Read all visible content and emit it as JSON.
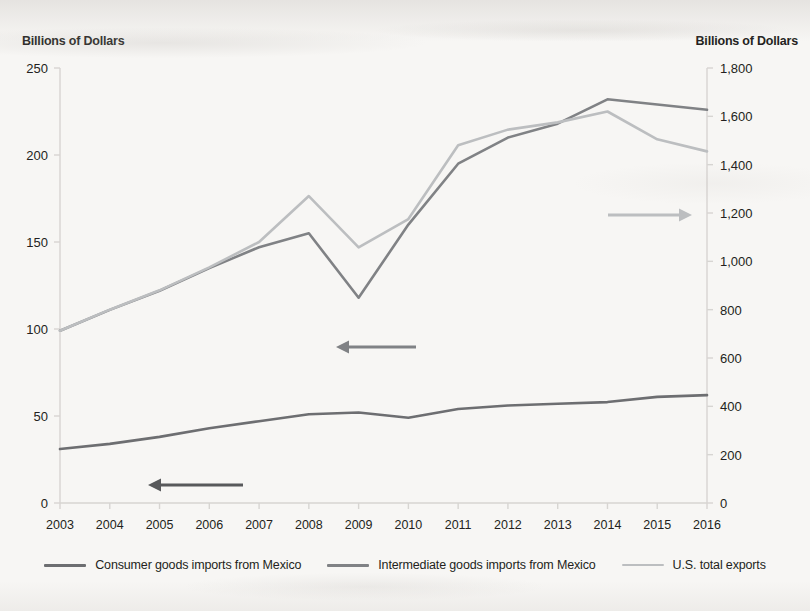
{
  "axis_titles": {
    "left": "Billions of Dollars",
    "right": "Billions of Dollars"
  },
  "colors": {
    "consumer": "#6d6e71",
    "intermediate": "#808285",
    "exports": "#bcbec0",
    "axis": "#d7d5d2",
    "text": "#231f20",
    "background": "#f7f6f4"
  },
  "annotations": [
    {
      "name": "consumer-axis-arrow",
      "direction": "left",
      "color": "#58595b",
      "label": ""
    },
    {
      "name": "intermediate-axis-arrow",
      "direction": "left",
      "color": "#808285",
      "label": ""
    },
    {
      "name": "exports-axis-arrow",
      "direction": "right",
      "color": "#bcbec0",
      "label": ""
    }
  ],
  "legend": [
    {
      "label": "Consumer goods imports from Mexico",
      "color": "#6d6e71",
      "style": "solid"
    },
    {
      "label": "Intermediate goods imports from Mexico",
      "color": "#808285",
      "style": "solid"
    },
    {
      "label": "U.S. total exports",
      "color": "#bcbec0",
      "style": "solid"
    }
  ],
  "chart_data": {
    "type": "line",
    "title": "",
    "xlabel": "",
    "ylabel": "Billions of Dollars",
    "y2label": "Billions of Dollars",
    "grid": false,
    "legend_position": "bottom",
    "x": [
      2003,
      2004,
      2005,
      2006,
      2007,
      2008,
      2009,
      2010,
      2011,
      2012,
      2013,
      2014,
      2015,
      2016
    ],
    "xtick_labels": [
      "2003",
      "2004",
      "2005",
      "2006",
      "2007",
      "2008",
      "2009",
      "2010",
      "2011",
      "2012",
      "2013",
      "2014",
      "2015",
      "2016"
    ],
    "ylim": [
      0,
      250
    ],
    "ytick_labels": [
      "0",
      "50",
      "100",
      "150",
      "200",
      "250"
    ],
    "ytick_values": [
      0,
      50,
      100,
      150,
      200,
      250
    ],
    "y2lim": [
      0,
      1800
    ],
    "y2tick_labels": [
      "0",
      "200",
      "400",
      "600",
      "800",
      "1,000",
      "1,200",
      "1,400",
      "1,600",
      "1,800"
    ],
    "y2tick_values": [
      0,
      200,
      400,
      600,
      800,
      1000,
      1200,
      1400,
      1600,
      1800
    ],
    "series": [
      {
        "name": "Consumer goods imports from Mexico",
        "axis": "left",
        "color": "#6d6e71",
        "values": [
          31,
          34,
          38,
          43,
          47,
          51,
          52,
          49,
          54,
          56,
          57,
          58,
          61,
          62
        ]
      },
      {
        "name": "Intermediate goods imports from Mexico",
        "axis": "left",
        "color": "#808285",
        "values": [
          99,
          111,
          122,
          135,
          147,
          155,
          118,
          160,
          195,
          210,
          218,
          232,
          229,
          226
        ]
      },
      {
        "name": "U.S. total exports",
        "axis": "right",
        "color": "#bcbec0",
        "values": [
          713,
          800,
          880,
          975,
          1080,
          1270,
          1058,
          1175,
          1480,
          1545,
          1575,
          1620,
          1505,
          1455
        ]
      }
    ]
  }
}
